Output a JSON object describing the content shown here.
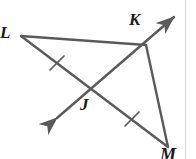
{
  "figure": {
    "canvas": {
      "width": 196,
      "height": 159,
      "background": "#ffffff"
    },
    "stroke_color": "#5a5a5a",
    "label_color": "#1b1b1b",
    "edge_line_color": "#d2d2d2",
    "stroke_width": 2.2,
    "labels": {
      "L": "L",
      "K": "K",
      "J": "J",
      "M": "M"
    },
    "points": {
      "L": {
        "x": 21,
        "y": 36
      },
      "K": {
        "x": 146,
        "y": 45
      },
      "M": {
        "x": 168,
        "y": 147
      },
      "J": {
        "x": 93,
        "y": 88
      },
      "ray_arrow_upper_right": {
        "x": 179,
        "y": 12
      },
      "ray_arrow_lower_left": {
        "x": 52,
        "y": 123
      }
    },
    "segments": [
      {
        "name": "segment-LK",
        "from": "L",
        "to": "K",
        "ticks": 0
      },
      {
        "name": "segment-KM",
        "from": "K",
        "to": "M",
        "ticks": 0
      },
      {
        "name": "segment-LM",
        "from": "L",
        "to": "M",
        "ticks": 2
      }
    ],
    "ray": {
      "name": "ray-through-J-and-K",
      "double_headed": true,
      "passes_through": [
        "J",
        "K"
      ]
    },
    "tick_marks": [
      {
        "name": "tick-LJ",
        "x": 57,
        "y": 63,
        "on_segment": "segment-LM"
      },
      {
        "name": "tick-JM",
        "x": 132,
        "y": 119,
        "on_segment": "segment-LM"
      }
    ]
  }
}
